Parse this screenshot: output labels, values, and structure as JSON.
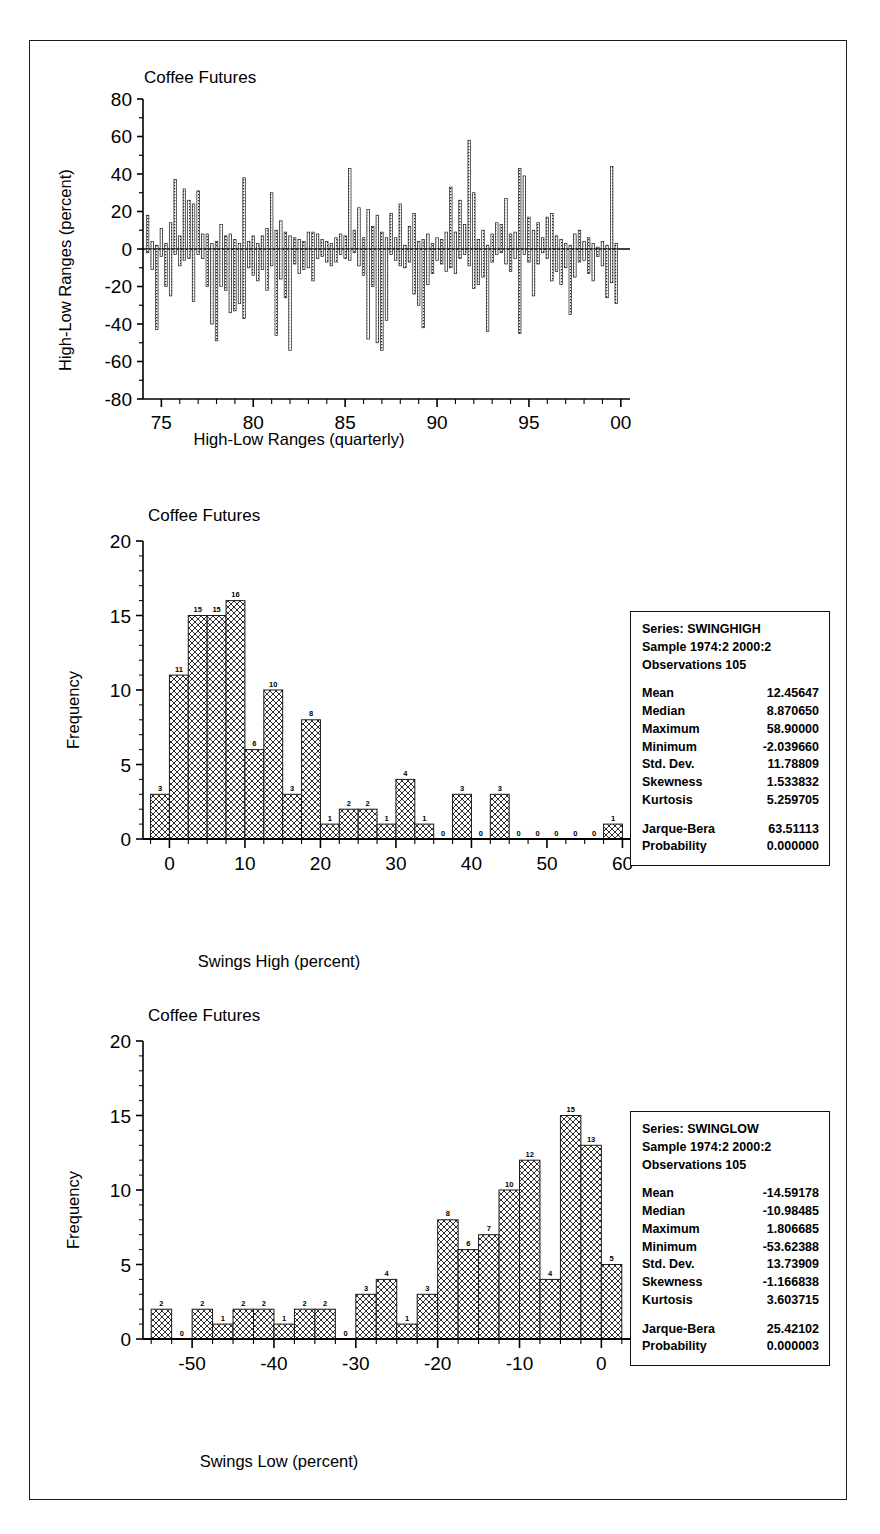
{
  "figure": {
    "panels": [
      {
        "id": "high-low-ranges",
        "title": "Coffee Futures",
        "ylabel": "High-Low Ranges (percent)",
        "xlabel": "High-Low Ranges (quarterly)",
        "yticks": [
          "80",
          "60",
          "40",
          "20",
          "0",
          "-20",
          "-40",
          "-60",
          "-80"
        ],
        "xticks": [
          "75",
          "80",
          "85",
          "90",
          "95",
          "00"
        ]
      },
      {
        "id": "swing-high",
        "title": "Coffee Futures",
        "ylabel": "Frequency",
        "xlabel": "Swings High (percent)",
        "yticks": [
          "20",
          "15",
          "10",
          "5",
          "0"
        ],
        "xticks": [
          "0",
          "10",
          "20",
          "30",
          "40",
          "50",
          "60"
        ],
        "stats": {
          "series": "Series: SWINGHIGH",
          "sample": "Sample 1974:2 2000:2",
          "observations": "Observations 105",
          "rows": [
            {
              "key": "Mean",
              "value": "12.45647"
            },
            {
              "key": "Median",
              "value": "8.870650"
            },
            {
              "key": "Maximum",
              "value": "58.90000"
            },
            {
              "key": "Minimum",
              "value": "-2.039660"
            },
            {
              "key": "Std. Dev.",
              "value": "11.78809"
            },
            {
              "key": "Skewness",
              "value": "1.533832"
            },
            {
              "key": "Kurtosis",
              "value": "5.259705"
            }
          ],
          "tail": [
            {
              "key": "Jarque-Bera",
              "value": "63.51113"
            },
            {
              "key": "Probability",
              "value": "0.000000"
            }
          ]
        }
      },
      {
        "id": "swing-low",
        "title": "Coffee Futures",
        "ylabel": "Frequency",
        "xlabel": "Swings Low (percent)",
        "yticks": [
          "20",
          "15",
          "10",
          "5",
          "0"
        ],
        "xticks": [
          "-50",
          "-40",
          "-30",
          "-20",
          "-10",
          "0"
        ],
        "stats": {
          "series": "Series: SWINGLOW",
          "sample": "Sample 1974:2 2000:2",
          "observations": "Observations 105",
          "rows": [
            {
              "key": "Mean",
              "value": "-14.59178"
            },
            {
              "key": "Median",
              "value": "-10.98485"
            },
            {
              "key": "Maximum",
              "value": "1.806685"
            },
            {
              "key": "Minimum",
              "value": "-53.62388"
            },
            {
              "key": "Std. Dev.",
              "value": "13.73909"
            },
            {
              "key": "Skewness",
              "value": "-1.166838"
            },
            {
              "key": "Kurtosis",
              "value": "3.603715"
            }
          ],
          "tail": [
            {
              "key": "Jarque-Bera",
              "value": "25.42102"
            },
            {
              "key": "Probability",
              "value": "0.000003"
            }
          ]
        }
      }
    ]
  },
  "chart_data": [
    {
      "type": "bar",
      "id": "high-low-ranges",
      "title": "Coffee Futures",
      "xlabel": "High-Low Ranges (quarterly)",
      "ylabel": "High-Low Ranges (percent)",
      "ylim": [
        -80,
        80
      ],
      "xlim": [
        1974.0,
        2000.5
      ],
      "grid": false,
      "note": "Quarterly paired swing-high (positive) and swing-low (negative) percent ranges, 1974:2 to 2000:2, 105 observations each.",
      "x": [
        1974.25,
        1974.5,
        1974.75,
        1975.0,
        1975.25,
        1975.5,
        1975.75,
        1976.0,
        1976.25,
        1976.5,
        1976.75,
        1977.0,
        1977.25,
        1977.5,
        1977.75,
        1978.0,
        1978.25,
        1978.5,
        1978.75,
        1979.0,
        1979.25,
        1979.5,
        1979.75,
        1980.0,
        1980.25,
        1980.5,
        1980.75,
        1981.0,
        1981.25,
        1981.5,
        1981.75,
        1982.0,
        1982.25,
        1982.5,
        1982.75,
        1983.0,
        1983.25,
        1983.5,
        1983.75,
        1984.0,
        1984.25,
        1984.5,
        1984.75,
        1985.0,
        1985.25,
        1985.5,
        1985.75,
        1986.0,
        1986.25,
        1986.5,
        1986.75,
        1987.0,
        1987.25,
        1987.5,
        1987.75,
        1988.0,
        1988.25,
        1988.5,
        1988.75,
        1989.0,
        1989.25,
        1989.5,
        1989.75,
        1990.0,
        1990.25,
        1990.5,
        1990.75,
        1991.0,
        1991.25,
        1991.5,
        1991.75,
        1992.0,
        1992.25,
        1992.5,
        1992.75,
        1993.0,
        1993.25,
        1993.5,
        1993.75,
        1994.0,
        1994.25,
        1994.5,
        1994.75,
        1995.0,
        1995.25,
        1995.5,
        1995.75,
        1996.0,
        1996.25,
        1996.5,
        1996.75,
        1997.0,
        1997.25,
        1997.5,
        1997.75,
        1998.0,
        1998.25,
        1998.5,
        1998.75,
        1999.0,
        1999.25,
        1999.5,
        1999.75,
        2000.0,
        2000.25
      ],
      "series": [
        {
          "name": "Swing High (percent)",
          "values": [
            18,
            4,
            2,
            11,
            3,
            14,
            37,
            7,
            32,
            26,
            24,
            31,
            8,
            8,
            3,
            4,
            13,
            7,
            8,
            5,
            3,
            38,
            4,
            7,
            3,
            7,
            11,
            30,
            10,
            15,
            9,
            7,
            6,
            5,
            4,
            9,
            9,
            8,
            5,
            4,
            3,
            6,
            8,
            7,
            43,
            10,
            22,
            6,
            21,
            12,
            18,
            9,
            6,
            19,
            6,
            24,
            2,
            12,
            19,
            4,
            5,
            8,
            3,
            6,
            5,
            9,
            33,
            9,
            26,
            13,
            58,
            30,
            5,
            10,
            2,
            8,
            14,
            13,
            27,
            8,
            9,
            43,
            39,
            17,
            10,
            14,
            6,
            17,
            19,
            7,
            5,
            3,
            2,
            8,
            10,
            4,
            6,
            3,
            1,
            4,
            2,
            44,
            3
          ]
        },
        {
          "name": "Swing Low (percent)",
          "values": [
            -2,
            -11,
            -43,
            -4,
            -20,
            -25,
            -3,
            -9,
            -6,
            -5,
            -28,
            -3,
            -5,
            -20,
            -40,
            -49,
            -20,
            -22,
            -34,
            -33,
            -29,
            -37,
            -10,
            -14,
            -17,
            -11,
            -22,
            -9,
            -46,
            -16,
            -26,
            -54,
            -8,
            -13,
            -11,
            -10,
            -17,
            -5,
            -4,
            -7,
            -9,
            -7,
            -3,
            -5,
            -6,
            -2,
            -9,
            -14,
            -48,
            -20,
            -50,
            -54,
            -38,
            -3,
            -6,
            -9,
            -10,
            -7,
            -24,
            -30,
            -42,
            -19,
            -13,
            -6,
            -8,
            -12,
            -10,
            -13,
            -5,
            -3,
            -9,
            -21,
            -19,
            -15,
            -44,
            -7,
            -3,
            -2,
            -8,
            -12,
            -5,
            -45,
            -3,
            -7,
            -25,
            -8,
            -2,
            -5,
            -17,
            -12,
            -19,
            -10,
            -35,
            -15,
            -7,
            -6,
            -13,
            -17,
            -4,
            -9,
            -26,
            -18,
            -29
          ]
        }
      ]
    },
    {
      "type": "bar",
      "id": "swing-high",
      "title": "Coffee Futures",
      "xlabel": "Swings High (percent)",
      "ylabel": "Frequency",
      "ylim": [
        0,
        20
      ],
      "xlim": [
        -3.5,
        61
      ],
      "grid": false,
      "bin_width": 2.5,
      "bin_starts": [
        -2.5,
        0,
        2.5,
        5,
        7.5,
        10,
        12.5,
        15,
        17.5,
        20,
        22.5,
        25,
        27.5,
        30,
        32.5,
        35,
        37.5,
        40,
        42.5,
        45,
        47.5,
        50,
        52.5,
        55,
        57.5
      ],
      "categories": [
        "-2.5",
        "0",
        "2.5",
        "5",
        "7.5",
        "10",
        "12.5",
        "15",
        "17.5",
        "20",
        "22.5",
        "25",
        "27.5",
        "30",
        "32.5",
        "35",
        "37.5",
        "40",
        "42.5",
        "45",
        "47.5",
        "50",
        "52.5",
        "55",
        "57.5"
      ],
      "values": [
        3,
        11,
        15,
        15,
        16,
        6,
        10,
        3,
        8,
        1,
        2,
        2,
        1,
        4,
        1,
        0,
        3,
        0,
        3,
        0,
        0,
        0,
        0,
        0,
        1
      ],
      "bar_labels": [
        "3",
        "11",
        "15",
        "15",
        "16",
        "6",
        "10",
        "3",
        "8",
        "1",
        "2",
        "2",
        "1",
        "4",
        "1",
        "0",
        "3",
        "0",
        "3",
        "0",
        "0",
        "0",
        "0",
        "0",
        "1"
      ]
    },
    {
      "type": "bar",
      "id": "swing-low",
      "title": "Coffee Futures",
      "xlabel": "Swings Low (percent)",
      "ylabel": "Frequency",
      "ylim": [
        0,
        20
      ],
      "xlim": [
        -56,
        3.5
      ],
      "grid": false,
      "bin_width": 2.5,
      "bin_starts": [
        -55,
        -52.5,
        -50,
        -47.5,
        -45,
        -42.5,
        -40,
        -37.5,
        -35,
        -32.5,
        -30,
        -27.5,
        -25,
        -22.5,
        -20,
        -17.5,
        -15,
        -12.5,
        -10,
        -7.5,
        -5,
        -2.5,
        0
      ],
      "categories": [
        "-55",
        "-52.5",
        "-50",
        "-47.5",
        "-45",
        "-42.5",
        "-40",
        "-37.5",
        "-35",
        "-32.5",
        "-30",
        "-27.5",
        "-25",
        "-22.5",
        "-20",
        "-17.5",
        "-15",
        "-12.5",
        "-10",
        "-7.5",
        "-5",
        "-2.5",
        "0"
      ],
      "values": [
        2,
        0,
        2,
        1,
        2,
        2,
        1,
        2,
        2,
        0,
        3,
        4,
        1,
        3,
        8,
        6,
        7,
        10,
        12,
        4,
        15,
        13,
        5
      ],
      "bar_labels": [
        "2",
        "0",
        "2",
        "1",
        "2",
        "2",
        "1",
        "2",
        "2",
        "0",
        "3",
        "4",
        "1",
        "3",
        "8",
        "6",
        "7",
        "10",
        "12",
        "4",
        "15",
        "13",
        "5"
      ]
    }
  ]
}
